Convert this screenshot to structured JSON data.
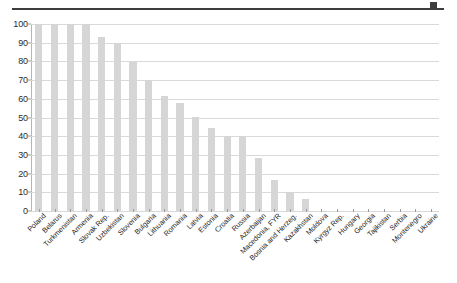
{
  "chart_data": {
    "type": "bar",
    "title": "",
    "subtitle": "",
    "xlabel": "",
    "ylabel": "",
    "ylim": [
      0,
      100
    ],
    "yticks": [
      0,
      10,
      20,
      30,
      40,
      50,
      60,
      70,
      80,
      90,
      100
    ],
    "grid": true,
    "legend": false,
    "legend_position": "none",
    "bar_color": "#d6d6d6",
    "gridline_color": "#d9d9d9",
    "axis_color": "#9a9a9a",
    "text_color": "#1f1f1f",
    "categories": [
      "Poland",
      "Belarus",
      "Turkmenistan",
      "Armenia",
      "Slovak Rep.",
      "Uzbekistan",
      "Slovenia",
      "Bulgaria",
      "Lithuania",
      "Romania",
      "Latvia",
      "Estonia",
      "Croatia",
      "Russia",
      "Azerbaijan",
      "Macedonia, FYR",
      "Bosnia and Herzeg.",
      "Kazakhstan",
      "Moldova",
      "Kyrgyz Rep.",
      "Hungary",
      "Georgia",
      "Tajikistan",
      "Serbia",
      "Montenegro",
      "Ukraine"
    ],
    "values": [
      100,
      100,
      100,
      100,
      93,
      90,
      79.5,
      70,
      61.5,
      57.5,
      50.5,
      44.5,
      40,
      40,
      28.5,
      16.5,
      10,
      6.5,
      0,
      0,
      0,
      0,
      0,
      0,
      0,
      0
    ]
  },
  "decorations": {
    "top_rule": "horizontal-rule",
    "top_rule_tick": "corner-mark"
  }
}
